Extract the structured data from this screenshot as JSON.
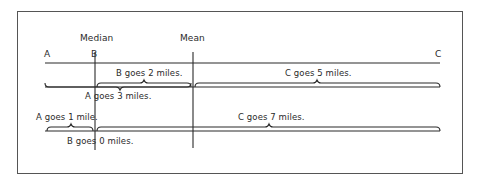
{
  "diagram": {
    "headers": {
      "median": "Median",
      "mean": "Mean"
    },
    "points": {
      "a": "A",
      "b": "B",
      "c": "C"
    },
    "row1": {
      "b_distance": "B goes 2 miles.",
      "c_distance": "C goes 5 miles.",
      "a_distance": "A goes 3 miles."
    },
    "row2": {
      "a_distance": "A goes 1 mile.",
      "c_distance": "C goes 7 miles.",
      "b_distance": "B goes 0 miles."
    },
    "colors": {
      "ink": "#2a2a2a",
      "frame": "#555555",
      "background": "#ffffff"
    }
  }
}
